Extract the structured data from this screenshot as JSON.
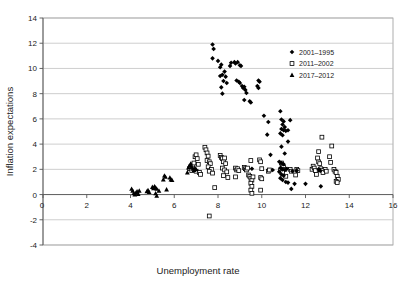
{
  "chart_data": {
    "type": "scatter",
    "title": "",
    "xlabel": "Unemployment rate",
    "ylabel": "Inflation expectations",
    "xlim": [
      0,
      16
    ],
    "ylim": [
      -4,
      14
    ],
    "xticks": [
      "0",
      "2",
      "4",
      "6",
      "8",
      "10",
      "12",
      "14",
      "16"
    ],
    "yticks": [
      "-4",
      "-2",
      "0",
      "2",
      "4",
      "6",
      "8",
      "10",
      "12",
      "14"
    ],
    "xtick_values": [
      0,
      2,
      4,
      6,
      8,
      10,
      12,
      14,
      16
    ],
    "ytick_values": [
      -4,
      -2,
      0,
      2,
      4,
      6,
      8,
      10,
      12,
      14
    ],
    "grid": "horizontal",
    "legend_position": "top-right",
    "origin_label": "0",
    "series": [
      {
        "name": "2001–1995",
        "marker": "diamond",
        "color": "#000000",
        "filled": true,
        "points": [
          [
            7.75,
            11.9
          ],
          [
            7.8,
            11.55
          ],
          [
            7.75,
            10.8
          ],
          [
            8.0,
            10.6
          ],
          [
            8.15,
            10.3
          ],
          [
            8.1,
            10.1
          ],
          [
            8.3,
            9.75
          ],
          [
            8.2,
            9.5
          ],
          [
            8.35,
            9.35
          ],
          [
            8.1,
            9.4
          ],
          [
            8.25,
            9.0
          ],
          [
            8.4,
            8.85
          ],
          [
            8.15,
            8.5
          ],
          [
            8.2,
            8.0
          ],
          [
            8.55,
            10.2
          ],
          [
            8.6,
            10.45
          ],
          [
            8.75,
            10.5
          ],
          [
            8.8,
            10.4
          ],
          [
            8.9,
            10.5
          ],
          [
            9.0,
            10.25
          ],
          [
            9.05,
            10.2
          ],
          [
            8.85,
            9.05
          ],
          [
            8.95,
            8.95
          ],
          [
            9.0,
            8.85
          ],
          [
            9.1,
            8.6
          ],
          [
            9.15,
            8.45
          ],
          [
            9.2,
            8.55
          ],
          [
            9.25,
            8.3
          ],
          [
            9.3,
            8.05
          ],
          [
            9.2,
            7.5
          ],
          [
            9.45,
            7.4
          ],
          [
            9.5,
            7.3
          ],
          [
            9.85,
            9.05
          ],
          [
            9.9,
            8.95
          ],
          [
            9.8,
            8.6
          ],
          [
            9.85,
            8.45
          ],
          [
            10.1,
            6.25
          ],
          [
            10.3,
            5.75
          ],
          [
            10.25,
            4.75
          ],
          [
            10.4,
            3.15
          ],
          [
            10.85,
            6.6
          ],
          [
            10.9,
            5.95
          ],
          [
            11.0,
            5.8
          ],
          [
            10.95,
            5.55
          ],
          [
            11.05,
            5.35
          ],
          [
            10.9,
            5.2
          ],
          [
            11.0,
            5.1
          ],
          [
            11.1,
            5.05
          ],
          [
            10.85,
            4.85
          ],
          [
            10.95,
            4.7
          ],
          [
            11.2,
            5.1
          ],
          [
            11.3,
            5.9
          ],
          [
            10.9,
            3.8
          ],
          [
            11.2,
            4.2
          ],
          [
            11.05,
            3.25
          ],
          [
            10.8,
            2.6
          ],
          [
            10.9,
            2.5
          ],
          [
            11.0,
            2.4
          ],
          [
            10.85,
            2.1
          ],
          [
            10.95,
            2.0
          ],
          [
            11.05,
            1.95
          ],
          [
            10.8,
            1.8
          ],
          [
            10.9,
            1.6
          ],
          [
            11.0,
            1.5
          ],
          [
            10.85,
            1.3
          ],
          [
            10.95,
            1.15
          ],
          [
            11.1,
            1.0
          ],
          [
            11.2,
            0.95
          ],
          [
            11.4,
            1.85
          ],
          [
            11.6,
            1.9
          ],
          [
            11.5,
            0.85
          ],
          [
            12.0,
            0.85
          ],
          [
            11.35,
            0.45
          ],
          [
            12.6,
            2.0
          ],
          [
            12.65,
            1.95
          ],
          [
            12.7,
            0.65
          ],
          [
            9.55,
            2.05
          ],
          [
            10.5,
            1.95
          ],
          [
            11.15,
            2.05
          ]
        ]
      },
      {
        "name": "2011–2002",
        "marker": "square",
        "color": "#000000",
        "filled": false,
        "points": [
          [
            6.7,
            2.05
          ],
          [
            6.75,
            2.2
          ],
          [
            6.8,
            1.9
          ],
          [
            6.85,
            2.35
          ],
          [
            6.9,
            2.5
          ],
          [
            6.95,
            3.0
          ],
          [
            7.0,
            3.15
          ],
          [
            7.05,
            2.85
          ],
          [
            7.1,
            2.4
          ],
          [
            7.0,
            1.85
          ],
          [
            7.15,
            1.75
          ],
          [
            7.2,
            1.6
          ],
          [
            7.4,
            3.75
          ],
          [
            7.45,
            3.55
          ],
          [
            7.5,
            3.3
          ],
          [
            7.55,
            3.05
          ],
          [
            7.5,
            2.7
          ],
          [
            7.6,
            2.6
          ],
          [
            7.65,
            2.45
          ],
          [
            7.55,
            2.2
          ],
          [
            7.7,
            2.0
          ],
          [
            7.6,
            1.85
          ],
          [
            7.75,
            1.7
          ],
          [
            7.85,
            0.55
          ],
          [
            7.6,
            -1.7
          ],
          [
            8.1,
            3.1
          ],
          [
            8.15,
            2.95
          ],
          [
            8.2,
            2.85
          ],
          [
            8.25,
            2.6
          ],
          [
            8.3,
            2.9
          ],
          [
            8.35,
            2.45
          ],
          [
            8.2,
            2.1
          ],
          [
            8.3,
            1.95
          ],
          [
            8.4,
            1.8
          ],
          [
            8.25,
            1.5
          ],
          [
            8.45,
            1.35
          ],
          [
            8.8,
            2.1
          ],
          [
            8.85,
            1.95
          ],
          [
            8.9,
            2.05
          ],
          [
            8.95,
            1.9
          ],
          [
            8.8,
            1.4
          ],
          [
            9.2,
            2.15
          ],
          [
            9.25,
            2.05
          ],
          [
            9.3,
            1.95
          ],
          [
            9.35,
            2.1
          ],
          [
            9.4,
            1.55
          ],
          [
            9.45,
            1.45
          ],
          [
            9.5,
            2.7
          ],
          [
            9.5,
            1.3
          ],
          [
            9.55,
            1.15
          ],
          [
            9.5,
            0.9
          ],
          [
            9.55,
            0.65
          ],
          [
            9.5,
            0.35
          ],
          [
            9.55,
            0.1
          ],
          [
            9.6,
            1.4
          ],
          [
            9.9,
            2.75
          ],
          [
            9.95,
            2.6
          ],
          [
            10.0,
            2.05
          ],
          [
            9.95,
            1.35
          ],
          [
            10.0,
            1.25
          ],
          [
            9.95,
            0.35
          ],
          [
            10.3,
            1.85
          ],
          [
            10.35,
            1.95
          ],
          [
            10.9,
            2.5
          ],
          [
            10.95,
            2.3
          ],
          [
            11.0,
            2.15
          ],
          [
            11.05,
            2.0
          ],
          [
            10.85,
            1.9
          ],
          [
            10.95,
            1.75
          ],
          [
            11.3,
            2.0
          ],
          [
            11.35,
            1.85
          ],
          [
            11.6,
            2.0
          ],
          [
            11.65,
            1.9
          ],
          [
            11.55,
            1.55
          ],
          [
            12.3,
            2.0
          ],
          [
            12.35,
            2.25
          ],
          [
            12.4,
            2.1
          ],
          [
            12.45,
            1.9
          ],
          [
            12.6,
            2.6
          ],
          [
            12.65,
            2.45
          ],
          [
            12.55,
            2.9
          ],
          [
            12.7,
            2.05
          ],
          [
            12.75,
            1.9
          ],
          [
            12.8,
            1.75
          ],
          [
            12.6,
            3.4
          ],
          [
            12.75,
            4.55
          ],
          [
            12.9,
            2.0
          ],
          [
            12.95,
            1.85
          ],
          [
            13.1,
            3.0
          ],
          [
            13.2,
            3.85
          ],
          [
            13.15,
            2.55
          ],
          [
            13.3,
            2.0
          ],
          [
            13.35,
            1.85
          ],
          [
            13.4,
            1.75
          ],
          [
            13.45,
            1.45
          ],
          [
            13.5,
            1.2
          ],
          [
            13.4,
            1.05
          ],
          [
            13.45,
            0.95
          ],
          [
            12.5,
            1.6
          ],
          [
            11.1,
            1.45
          ]
        ]
      },
      {
        "name": "2017–2012",
        "marker": "triangle",
        "color": "#000000",
        "filled": true,
        "points": [
          [
            4.05,
            0.45
          ],
          [
            4.1,
            0.3
          ],
          [
            4.15,
            0.1
          ],
          [
            4.2,
            0.0
          ],
          [
            4.25,
            0.15
          ],
          [
            4.3,
            0.25
          ],
          [
            4.35,
            0.05
          ],
          [
            4.4,
            0.3
          ],
          [
            4.75,
            0.25
          ],
          [
            4.8,
            0.35
          ],
          [
            4.85,
            0.2
          ],
          [
            5.0,
            0.6
          ],
          [
            5.05,
            0.5
          ],
          [
            5.1,
            0.65
          ],
          [
            5.15,
            0.55
          ],
          [
            5.2,
            0.45
          ],
          [
            5.15,
            0.1
          ],
          [
            5.2,
            -0.1
          ],
          [
            5.3,
            0.3
          ],
          [
            5.55,
            1.5
          ],
          [
            5.6,
            1.4
          ],
          [
            5.5,
            1.2
          ],
          [
            5.65,
            0.4
          ],
          [
            5.8,
            1.35
          ],
          [
            5.85,
            1.2
          ],
          [
            5.9,
            1.15
          ],
          [
            6.65,
            2.15
          ],
          [
            6.7,
            2.3
          ],
          [
            6.75,
            2.45
          ],
          [
            6.8,
            2.2
          ],
          [
            6.85,
            2.05
          ],
          [
            6.9,
            1.95
          ],
          [
            6.95,
            2.1
          ],
          [
            7.0,
            2.0
          ],
          [
            6.6,
            1.75
          ],
          [
            12.65,
            1.95
          ]
        ]
      }
    ]
  }
}
